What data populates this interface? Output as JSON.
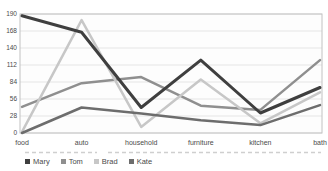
{
  "chart_data": {
    "type": "line",
    "title": "",
    "xlabel": "",
    "ylabel": "",
    "categories": [
      "food",
      "auto",
      "household",
      "furniture",
      "kitchen",
      "bath"
    ],
    "series": [
      {
        "name": "Mary",
        "color": "#3f3f3f",
        "line_width": 3,
        "values": [
          193,
          166,
          42,
          120,
          33,
          75
        ]
      },
      {
        "name": "Tom",
        "color": "#8f8f8f",
        "line_width": 2.5,
        "values": [
          43,
          82,
          92,
          45,
          38,
          120
        ]
      },
      {
        "name": "Brad",
        "color": "#c7c7c7",
        "line_width": 2.5,
        "values": [
          2,
          186,
          10,
          88,
          16,
          67
        ]
      },
      {
        "name": "Kate",
        "color": "#6d6d6d",
        "line_width": 2.5,
        "values": [
          0,
          42,
          32,
          21,
          13,
          46
        ]
      }
    ],
    "y_axis": {
      "min": 0,
      "max": 196,
      "tick_interval": 28,
      "tick_labels": [
        "0",
        "28",
        "56",
        "84",
        "112",
        "140",
        "168",
        "190"
      ]
    },
    "grid": true,
    "legend_position": "bottom-left"
  },
  "colors": {
    "grid_line": "#dcdcdc",
    "plot_border": "#c2c2c2",
    "axis_text": "#4a4a4a",
    "dashed_rule": "#cfcfcf",
    "plot_background": "#fdfdfd"
  }
}
